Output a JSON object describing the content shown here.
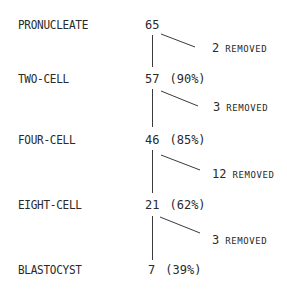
{
  "stages": [
    {
      "label": "PRONUCLEATE",
      "count": "65",
      "pct": ""
    },
    {
      "label": "TWO-CELL",
      "count": "57",
      "pct": "(90%)"
    },
    {
      "label": "FOUR-CELL",
      "count": "46",
      "pct": "(85%)"
    },
    {
      "label": "EIGHT-CELL",
      "count": "21",
      "pct": "(62%)"
    },
    {
      "label": "BLASTOCYST",
      "count": "7",
      "pct": "(39%)"
    }
  ],
  "removals": [
    {
      "number": "2",
      "word": "REMOVED"
    },
    {
      "number": "3",
      "word": "REMOVED"
    },
    {
      "number": "12",
      "word": "REMOVED"
    },
    {
      "number": "3",
      "word": "REMOVED"
    }
  ],
  "colors": {
    "ink": "#2a2a2a",
    "background": "#ffffff"
  }
}
